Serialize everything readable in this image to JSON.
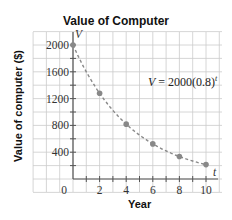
{
  "chart_data": {
    "type": "line",
    "title": "Value of Computer",
    "xlabel": "Year",
    "ylabel": "Value of computer ($)",
    "x_axis_var": "t",
    "y_axis_var": "V",
    "origin_label": "0",
    "x_ticks": [
      "2",
      "4",
      "6",
      "8",
      "10"
    ],
    "y_ticks": [
      "400",
      "800",
      "1200",
      "1600",
      "2000"
    ],
    "xlim": [
      0,
      10
    ],
    "ylim": [
      0,
      2000
    ],
    "grid": true,
    "equation": "V = 2000(0.8)",
    "equation_exponent": "t",
    "series": [
      {
        "name": "V = 2000(0.8)^t",
        "style": "dashed",
        "x": [
          0,
          2,
          4,
          6,
          8,
          10
        ],
        "values": [
          2000,
          1280,
          819,
          524,
          336,
          215
        ]
      }
    ],
    "colors": {
      "curve": "#888888",
      "points": "#888888",
      "grid": "#cccccc",
      "axis": "#555555"
    }
  }
}
